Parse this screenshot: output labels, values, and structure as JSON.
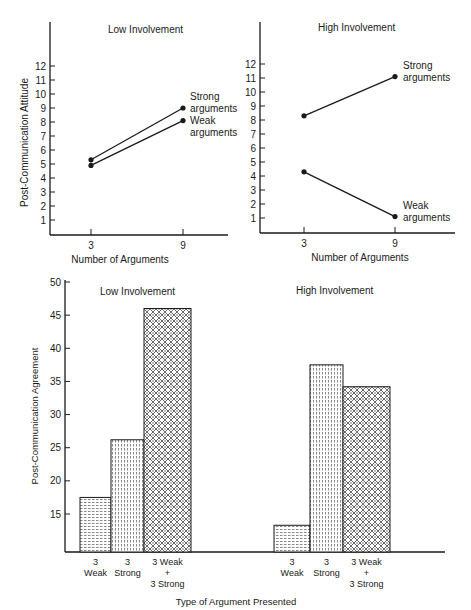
{
  "chart_data": [
    {
      "type": "line",
      "title": "Low Involvement",
      "xlabel": "Number of Arguments",
      "ylabel": "Post-Communication Attitude",
      "x": [
        3,
        9
      ],
      "x_ticks": [
        "3",
        "9"
      ],
      "y_ticks": [
        "1",
        "2",
        "3",
        "4",
        "5",
        "6",
        "7",
        "8",
        "9",
        "10",
        "11",
        "12"
      ],
      "ylim": [
        0,
        12.8
      ],
      "grid": false,
      "series": [
        {
          "name": "Strong arguments",
          "label_lines": [
            "Strong",
            "arguments"
          ],
          "values": [
            5.3,
            9.0
          ]
        },
        {
          "name": "Weak arguments",
          "label_lines": [
            "Weak",
            "arguments"
          ],
          "values": [
            4.9,
            8.1
          ]
        }
      ]
    },
    {
      "type": "line",
      "title": "High Involvement",
      "xlabel": "Number of Arguments",
      "ylabel": "",
      "x": [
        3,
        9
      ],
      "x_ticks": [
        "3",
        "9"
      ],
      "y_ticks": [
        "1",
        "2",
        "3",
        "4",
        "5",
        "6",
        "7",
        "8",
        "9",
        "10",
        "11",
        "12"
      ],
      "ylim": [
        0,
        12.8
      ],
      "grid": false,
      "series": [
        {
          "name": "Strong arguments",
          "label_lines": [
            "Strong",
            "arguments"
          ],
          "values": [
            8.3,
            11.1
          ]
        },
        {
          "name": "Weak arguments",
          "label_lines": [
            "Weak",
            "arguments"
          ],
          "values": [
            4.3,
            1.1
          ]
        }
      ]
    },
    {
      "type": "bar",
      "title": "",
      "ylabel": "Post-Communication Agreement",
      "xlabel": "Type of Argument Presented",
      "y_ticks": [
        "15",
        "20",
        "25",
        "30",
        "35",
        "40",
        "45",
        "50"
      ],
      "ylim": [
        9,
        50
      ],
      "grid": false,
      "groups": [
        {
          "name": "Low Involvement",
          "categories": [
            [
              "3",
              "Weak"
            ],
            [
              "3",
              "Strong"
            ],
            [
              "3 Weak",
              "+",
              "3 Strong"
            ]
          ],
          "values": [
            17.5,
            26.2,
            46.0
          ]
        },
        {
          "name": "High Involvement",
          "categories": [
            [
              "3",
              "Weak"
            ],
            [
              "3",
              "Strong"
            ],
            [
              "3 Weak",
              "+",
              "3 Strong"
            ]
          ],
          "values": [
            13.3,
            37.5,
            34.2
          ]
        }
      ]
    }
  ]
}
